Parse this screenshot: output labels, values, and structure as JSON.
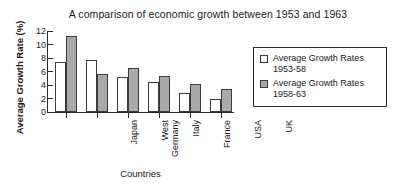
{
  "chart_data": {
    "type": "bar",
    "title": "A comparison of economic growth between 1953 and 1963",
    "xlabel": "Countries",
    "ylabel": "Average Growth Rate (%)",
    "categories": [
      "Japan",
      "West Germany",
      "Italy",
      "France",
      "USA",
      "UK"
    ],
    "category_lines": [
      [
        "Japan"
      ],
      [
        "West",
        "Germany"
      ],
      [
        "Italy"
      ],
      [
        "France"
      ],
      [
        "USA"
      ],
      [
        "UK"
      ]
    ],
    "series": [
      {
        "name": "Average Growth Rates 1953-58",
        "name_lines": [
          "Average Growth Rates",
          "1953-58"
        ],
        "color": "#ffffff",
        "values": [
          7.4,
          7.7,
          5.2,
          4.4,
          2.8,
          1.9
        ]
      },
      {
        "name": "Average Growth Rates 1958-63",
        "name_lines": [
          "Average Growth Rates",
          "1958-63"
        ],
        "color": "#a9a9a9",
        "values": [
          11.2,
          5.7,
          6.5,
          5.4,
          4.1,
          3.4
        ]
      }
    ],
    "ylim": [
      0,
      12
    ],
    "yticks": [
      0,
      2,
      4,
      6,
      8,
      10,
      12
    ],
    "ytick_labels": [
      "0",
      "2",
      "4",
      "6",
      "8",
      "10",
      "12"
    ],
    "grid": false,
    "legend_position": "right"
  },
  "colors": {
    "axis": "#2b2b2b",
    "bar_outline": "#3a3a3a",
    "series_1": "#ffffff",
    "series_2": "#a9a9a9",
    "background": "#ffffff"
  }
}
